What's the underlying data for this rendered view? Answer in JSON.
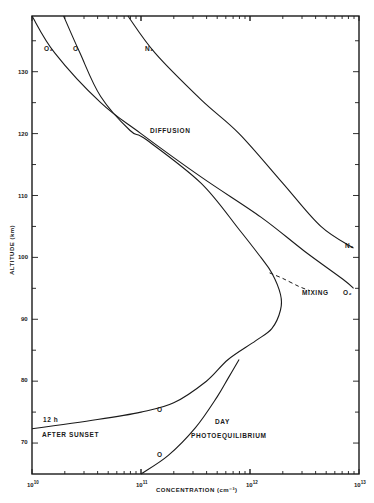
{
  "chart_data": {
    "type": "line",
    "title": "",
    "xlabel": "CONCENTRATION (cm⁻³)",
    "ylabel": "ALTITUDE (km)",
    "xscale": "log",
    "xlim": [
      10000000000.0,
      10000000000000.0
    ],
    "ylim": [
      65,
      139
    ],
    "x_ticks": [
      "10¹⁰",
      "10¹¹",
      "10¹²",
      "10¹³"
    ],
    "y_ticks": [
      70,
      80,
      90,
      100,
      110,
      120,
      130
    ],
    "grid": false,
    "legend": "none (curves labeled inline)",
    "series": [
      {
        "name": "O2",
        "style": "solid",
        "points_log10_conc_vs_alt": [
          [
            10.0,
            139
          ],
          [
            10.21,
            133
          ],
          [
            10.63,
            125
          ],
          [
            11.0,
            120
          ],
          [
            11.55,
            113
          ],
          [
            12.1,
            106.5
          ],
          [
            12.5,
            101
          ],
          [
            12.85,
            96.5
          ],
          [
            12.95,
            95
          ]
        ]
      },
      {
        "name": "O",
        "style": "solid",
        "points_log10_conc_vs_alt": [
          [
            10.29,
            139
          ],
          [
            10.44,
            133
          ],
          [
            10.63,
            126
          ],
          [
            10.9,
            120.5
          ],
          [
            11.05,
            119
          ],
          [
            11.55,
            112
          ],
          [
            11.9,
            104.5
          ],
          [
            12.1,
            100
          ],
          [
            12.2,
            97.5
          ],
          [
            12.28,
            94
          ],
          [
            12.28,
            91.5
          ],
          [
            12.2,
            88.5
          ],
          [
            12.05,
            86.5
          ],
          [
            11.8,
            83.5
          ],
          [
            11.6,
            80
          ],
          [
            11.3,
            76.5
          ],
          [
            11.0,
            75
          ],
          [
            10.6,
            73.8
          ],
          [
            10.0,
            72.3
          ]
        ]
      },
      {
        "name": "O (day photoequilibrium)",
        "style": "solid",
        "points_log10_conc_vs_alt": [
          [
            11.0,
            65
          ],
          [
            11.25,
            68
          ],
          [
            11.5,
            72.5
          ],
          [
            11.7,
            77.5
          ],
          [
            11.8,
            80.5
          ],
          [
            11.9,
            83.5
          ]
        ]
      },
      {
        "name": "N2",
        "style": "solid",
        "points_log10_conc_vs_alt": [
          [
            10.88,
            139
          ],
          [
            11.13,
            133
          ],
          [
            11.55,
            125.5
          ],
          [
            11.9,
            120
          ],
          [
            12.3,
            112
          ],
          [
            12.65,
            105
          ],
          [
            12.95,
            101.5
          ]
        ]
      },
      {
        "name": "O (mixing)",
        "style": "dashed",
        "points_log10_conc_vs_alt": [
          [
            12.18,
            97.5
          ],
          [
            12.3,
            96.6
          ],
          [
            12.45,
            95.3
          ],
          [
            12.55,
            94.6
          ]
        ]
      }
    ],
    "annotations": [
      "DIFFUSION",
      "MIXING",
      "12 h",
      "AFTER SUNSET",
      "DAY",
      "PHOTOEQUILIBRIUM",
      "O",
      "O",
      "O2",
      "O",
      "N2",
      "N2",
      "O2"
    ]
  },
  "labels": {
    "o2_top": "O₂",
    "o_top": "O",
    "n2_top": "N₂",
    "n2_right": "N₂",
    "o2_right": "O₂",
    "o_night": "O",
    "o_day": "O",
    "diffusion": "DIFFUSION",
    "mixing": "MIXING",
    "after_sunset_1": "12 h",
    "after_sunset_2": "AFTER SUNSET",
    "day_1": "DAY",
    "day_2": "PHOTOEQUILIBRIUM"
  },
  "axis": {
    "x_title": "CONCENTRATION  (cm⁻³)",
    "y_title": "ALTITUDE (km)",
    "x_tick_labels": [
      {
        "base": "10",
        "exp": "10"
      },
      {
        "base": "10",
        "exp": "11"
      },
      {
        "base": "10",
        "exp": "12"
      },
      {
        "base": "10",
        "exp": "13"
      }
    ],
    "y_tick_labels": [
      "130",
      "120",
      "110",
      "100",
      "90",
      "80",
      "70"
    ]
  }
}
